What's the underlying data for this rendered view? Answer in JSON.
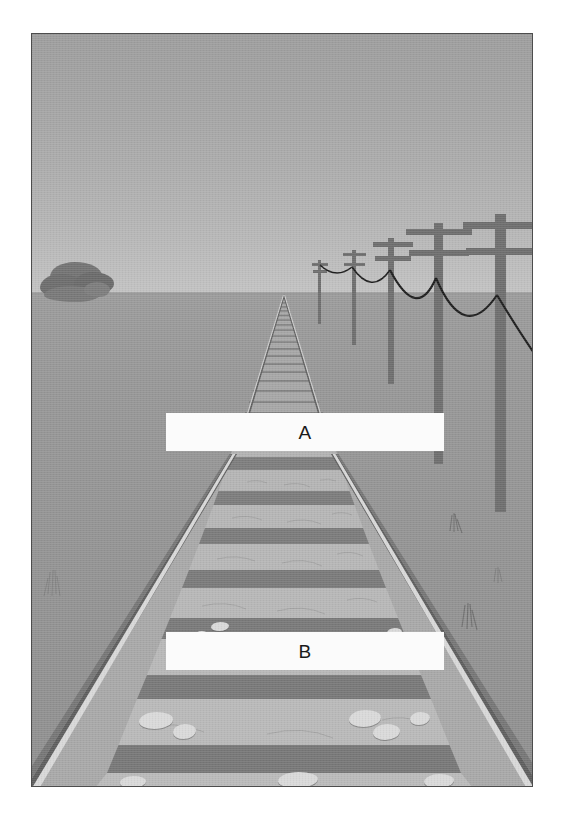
{
  "figure": {
    "kind": "perspective-illustration",
    "frame": {
      "border_color": "#4d4d4d",
      "page_background": "#ffffff"
    },
    "palette": {
      "sky_top": "#9d9d9d",
      "sky_horizon": "#c2c2c2",
      "ground_near_horizon": "#9b9b9b",
      "ground_foreground": "#8f8f8f",
      "rail": "#d6d6d6",
      "rail_shadow": "#6b6b6b",
      "tie": "#7b7b7b",
      "ballast": "#acacac",
      "pebble": "#d9d9d9",
      "pole": "#6e6e6e",
      "wire": "#1d1d1d",
      "rock_formation": "#6f6f6f",
      "label_background": "#fbfbfb",
      "label_text": "#1a1a1a"
    },
    "geometry": {
      "vanishing_point_x": 252,
      "vanishing_point_y": 260,
      "horizon_y": 259
    }
  },
  "labels": [
    {
      "id": "a",
      "text": "A",
      "name": "label-a",
      "region": "mid-distance-track"
    },
    {
      "id": "b",
      "text": "B",
      "name": "label-b",
      "region": "foreground-track"
    }
  ],
  "scene": {
    "sky": {
      "name": "sky"
    },
    "ground": {
      "name": "ground"
    },
    "horizon": {
      "name": "horizon-line"
    },
    "rock_formation": {
      "name": "distant-rock-formation",
      "side": "left"
    },
    "track": {
      "name": "railroad-track",
      "tie_count": 42,
      "rail_count": 2
    },
    "utility_poles": [
      {
        "id": 1,
        "name": "utility-pole-1",
        "distance": "farthest",
        "crossarms": 2
      },
      {
        "id": 2,
        "name": "utility-pole-2",
        "distance": "far",
        "crossarms": 2
      },
      {
        "id": 3,
        "name": "utility-pole-3",
        "distance": "mid",
        "crossarms": 2
      },
      {
        "id": 4,
        "name": "utility-pole-4",
        "distance": "near",
        "crossarms": 2
      },
      {
        "id": 5,
        "name": "utility-pole-5",
        "distance": "nearest",
        "crossarms": 2
      }
    ],
    "wires": {
      "name": "power-line-wires",
      "span_count": 4
    },
    "grass_tufts": {
      "name": "grass-tufts",
      "count": 4
    },
    "ballast_rocks": {
      "name": "ballast-rocks",
      "count": 14
    }
  }
}
